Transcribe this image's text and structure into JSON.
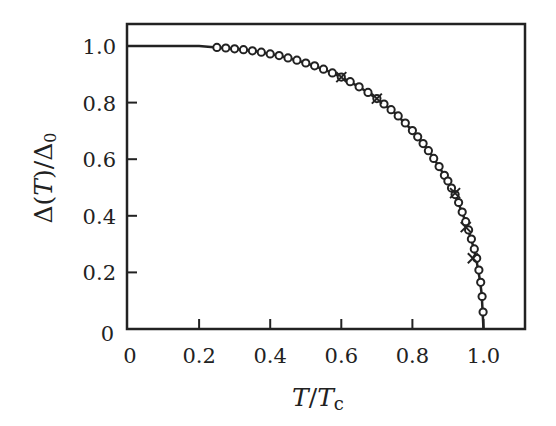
{
  "chart_data": {
    "type": "scatter",
    "title": "",
    "xlabel": "T/Tc",
    "ylabel": "Δ(T)/Δ0",
    "xlim": [
      0,
      1.115
    ],
    "ylim": [
      0,
      1.07
    ],
    "grid": false,
    "legend": null,
    "x_ticks": [
      0,
      0.2,
      0.4,
      0.6,
      0.8,
      1.0
    ],
    "x_tick_labels": [
      "0",
      "0.2",
      "0.4",
      "0.6",
      "0.8",
      "1.0"
    ],
    "y_ticks": [
      0,
      0.2,
      0.4,
      0.6,
      0.8,
      1.0
    ],
    "y_tick_labels": [
      "0",
      "0.2",
      "0.4",
      "0.6",
      "0.8",
      "1.0"
    ],
    "series": [
      {
        "name": "BCS theory (line)",
        "style": "line",
        "x": [
          0,
          0.05,
          0.1,
          0.15,
          0.2,
          0.25,
          0.3,
          0.35,
          0.4,
          0.45,
          0.5,
          0.55,
          0.6,
          0.65,
          0.7,
          0.75,
          0.8,
          0.85,
          0.9,
          0.925,
          0.95,
          0.97,
          0.98,
          0.99,
          0.995,
          1.0
        ],
        "y": [
          1.0,
          1.0,
          1.0,
          1.0,
          1.0,
          0.995,
          0.99,
          0.983,
          0.972,
          0.958,
          0.94,
          0.918,
          0.89,
          0.856,
          0.814,
          0.764,
          0.701,
          0.623,
          0.523,
          0.459,
          0.379,
          0.297,
          0.244,
          0.173,
          0.123,
          0.0
        ]
      },
      {
        "name": "circles",
        "style": "o",
        "x": [
          0.25,
          0.275,
          0.3,
          0.325,
          0.35,
          0.375,
          0.4,
          0.425,
          0.45,
          0.475,
          0.5,
          0.525,
          0.55,
          0.575,
          0.6,
          0.625,
          0.65,
          0.675,
          0.7,
          0.72,
          0.74,
          0.76,
          0.78,
          0.8,
          0.815,
          0.83,
          0.845,
          0.86,
          0.875,
          0.89,
          0.9,
          0.91,
          0.92,
          0.93,
          0.94,
          0.95,
          0.958,
          0.966,
          0.974,
          0.981,
          0.987,
          0.992,
          0.996,
          0.999
        ],
        "y": [
          0.995,
          0.993,
          0.99,
          0.987,
          0.983,
          0.978,
          0.972,
          0.966,
          0.958,
          0.95,
          0.94,
          0.93,
          0.918,
          0.905,
          0.89,
          0.874,
          0.856,
          0.836,
          0.814,
          0.795,
          0.775,
          0.753,
          0.728,
          0.701,
          0.679,
          0.655,
          0.63,
          0.603,
          0.574,
          0.543,
          0.523,
          0.498,
          0.475,
          0.447,
          0.413,
          0.379,
          0.35,
          0.318,
          0.283,
          0.25,
          0.208,
          0.165,
          0.115,
          0.06
        ]
      },
      {
        "name": "crosses",
        "style": "x",
        "x": [
          0.6,
          0.7,
          0.92,
          0.95,
          0.97
        ],
        "y": [
          0.89,
          0.814,
          0.48,
          0.36,
          0.25
        ]
      }
    ]
  },
  "plot": {
    "x_tick_labels": [
      "0",
      "0.2",
      "0.4",
      "0.6",
      "0.8",
      "1.0"
    ],
    "y_tick_labels": [
      "0",
      "0.2",
      "0.4",
      "0.6",
      "0.8",
      "1.0"
    ],
    "xlabel_main": "T",
    "xlabel_slash": "/",
    "xlabel_sub_base": "T",
    "xlabel_sub": "c",
    "ylabel_delta": "Δ(",
    "ylabel_T": "T",
    "ylabel_rest": ")/Δ",
    "ylabel_sub": "0"
  },
  "colors": {
    "ink": "#222222",
    "background": "#ffffff"
  }
}
